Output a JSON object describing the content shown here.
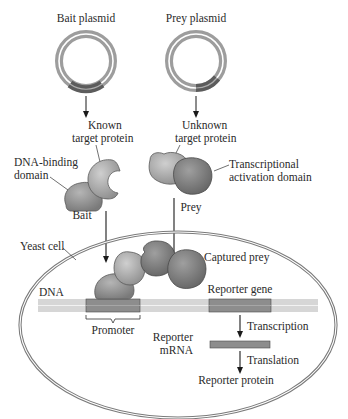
{
  "plasmids": {
    "bait": {
      "label": "Bait plasmid"
    },
    "prey": {
      "label": "Prey plasmid"
    }
  },
  "proteins": {
    "known_line1": "Known",
    "known_line2": "target protein",
    "unknown_line1": "Unknown",
    "unknown_line2": "target protein",
    "dna_binding_line1": "DNA-binding",
    "dna_binding_line2": "domain",
    "activation_line1": "Transcriptional",
    "activation_line2": "activation domain",
    "bait": "Bait",
    "prey": "Prey"
  },
  "cell": {
    "yeast_cell": "Yeast cell",
    "captured_prey": "Captured prey",
    "dna": "DNA",
    "reporter_gene": "Reporter gene",
    "promoter": "Promoter",
    "transcription": "Transcription",
    "reporter_mrna_line1": "Reporter",
    "reporter_mrna_line2": "mRNA",
    "translation": "Translation",
    "reporter_protein": "Reporter protein"
  },
  "colors": {
    "plasmid_ring": "#9a9a9a",
    "plasmid_dark": "#5f5f5f",
    "protein_light": "#b8b8b8",
    "protein_mid": "#9c9c9c",
    "protein_dark": "#7e7e7e",
    "dna_light": "#d4d4d4",
    "dna_segment": "#8a8a8a",
    "cell_outline": "#7a7a7a"
  }
}
